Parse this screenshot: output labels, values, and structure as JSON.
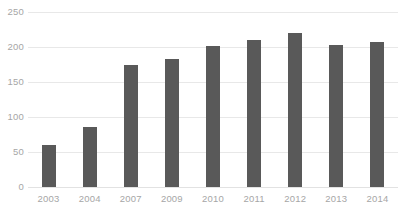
{
  "chart_data": {
    "type": "bar",
    "title": "",
    "subtitle": "",
    "xlabel": "",
    "ylabel": "",
    "categories": [
      "2003",
      "2004",
      "2007",
      "2009",
      "2010",
      "2011",
      "2012",
      "2013",
      "2014"
    ],
    "values": [
      60,
      86,
      174,
      183,
      201,
      210,
      220,
      203,
      207
    ],
    "series": [
      {
        "name": "",
        "values": [
          60,
          86,
          174,
          183,
          201,
          210,
          220,
          203,
          207
        ]
      }
    ],
    "ylim": [
      0,
      250
    ],
    "yticks": [
      0,
      50,
      100,
      150,
      200,
      250
    ],
    "ytick_labels": [
      "0",
      "50",
      "100",
      "150",
      "200",
      "250"
    ],
    "grid": true,
    "grid_axis": "y",
    "legend": false,
    "legend_position": "none",
    "annotations": [],
    "data_labels": false,
    "colors": {
      "bar": "#595959",
      "gridline": "#e8e8e8",
      "axis_text": "#a6a6a6",
      "background": "#ffffff"
    }
  }
}
